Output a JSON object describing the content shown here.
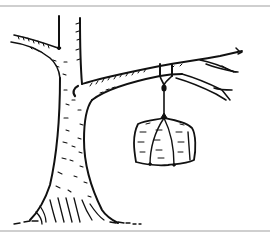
{
  "illustration": {
    "subject": "Bag hanging from a tree branch by a rope",
    "style": "black ink line drawing on white",
    "elements": [
      "tree-trunk",
      "left-branch",
      "right-branch",
      "twigs",
      "rope",
      "hanging-bag",
      "roots",
      "ground"
    ],
    "colors": {
      "ink": "#111111",
      "background": "#ffffff",
      "frame_rule": "#cfcfcf"
    }
  }
}
